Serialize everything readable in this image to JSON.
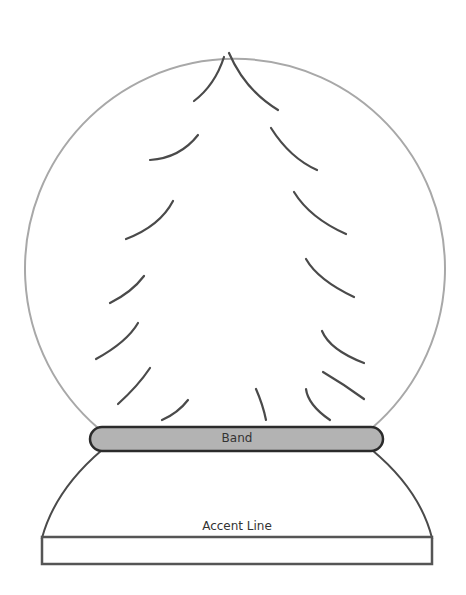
{
  "diagram": {
    "labels": {
      "band": "Band",
      "accent_line": "Accent Line"
    },
    "colors": {
      "globe_outline": "#a8a8a8",
      "branch_stroke": "#4a4a4a",
      "band_fill": "#b3b3b3",
      "band_stroke": "#2b2b2b",
      "base_stroke": "#555555",
      "background": "#ffffff"
    },
    "parts": [
      {
        "id": "globe",
        "label": "Globe",
        "shape": "circle"
      },
      {
        "id": "tree",
        "label": "Tree branches",
        "count": 16
      },
      {
        "id": "band",
        "label": "Band",
        "shape": "rounded-rect"
      },
      {
        "id": "base-dome",
        "label": "Base dome",
        "shape": "arch"
      },
      {
        "id": "base-plinth",
        "label": "Accent Line",
        "shape": "rect"
      }
    ]
  }
}
